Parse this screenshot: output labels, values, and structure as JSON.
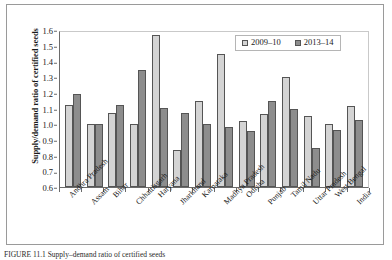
{
  "chart_data": {
    "type": "bar",
    "title": "",
    "xlabel": "",
    "ylabel": "Supply/demand ratio of certified seeds",
    "ylim": [
      0.6,
      1.6
    ],
    "ytick_step": 0.1,
    "yticks": [
      "1.6",
      "1.5",
      "1.4",
      "1.3",
      "1.2",
      "1.1",
      "1.0",
      "0.9",
      "0.8",
      "0.7",
      "0.6"
    ],
    "grid": false,
    "legend_position": "top-right",
    "categories": [
      "Andhra Pradesh",
      "Assam",
      "Bihar",
      "Chhattisgarh",
      "Haryana",
      "Jharkhand",
      "Karnataka",
      "Madhya Pradesh",
      "Odisha",
      "Punjab",
      "Tamil Nadu",
      "Uttar Pradesh",
      "West Bengal",
      "India"
    ],
    "series": [
      {
        "name": "2009–10",
        "color": "#d4d4d4",
        "values": [
          1.12,
          1.0,
          1.07,
          1.0,
          1.57,
          0.835,
          1.15,
          1.445,
          1.02,
          1.065,
          1.3,
          1.05,
          1.0,
          1.115
        ]
      },
      {
        "name": "2013–14",
        "color": "#8d8d8d",
        "values": [
          1.19,
          1.0,
          1.12,
          1.345,
          1.105,
          1.07,
          1.0,
          0.985,
          0.955,
          1.145,
          1.1,
          0.85,
          0.96,
          1.03
        ]
      }
    ]
  },
  "legend": {
    "items": [
      {
        "label": "2009–10",
        "swatch": "light-gray-swatch"
      },
      {
        "label": "2013–14",
        "swatch": "dark-gray-swatch"
      }
    ]
  },
  "caption": {
    "text": "FIGURE 11.1   Supply–demand ratio of certified seeds"
  }
}
